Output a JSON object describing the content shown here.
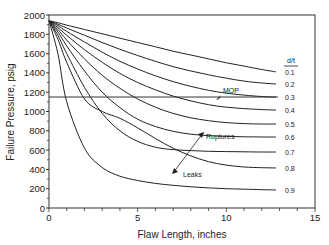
{
  "chart_data": {
    "type": "line",
    "title": "",
    "xlabel": "Flaw Length, inches",
    "ylabel": "Failure Pressure, psig",
    "xlim": [
      0,
      15
    ],
    "ylim": [
      0,
      2000
    ],
    "x_ticks": [
      0,
      5,
      10,
      15
    ],
    "y_ticks": [
      0,
      200,
      400,
      600,
      800,
      1000,
      1200,
      1400,
      1600,
      1800,
      2000
    ],
    "grid": false,
    "legend_title": "d/t",
    "legend_position": "right",
    "x": [
      0,
      0.5,
      1,
      2,
      3,
      4,
      5,
      6,
      7,
      8,
      9,
      10,
      11,
      12,
      12.8
    ],
    "series": [
      {
        "name": "0.1",
        "values": [
          1940,
          1920,
          1895,
          1850,
          1805,
          1760,
          1715,
          1670,
          1625,
          1585,
          1545,
          1505,
          1470,
          1435,
          1410
        ]
      },
      {
        "name": "0.2",
        "values": [
          1940,
          1905,
          1865,
          1790,
          1715,
          1645,
          1580,
          1520,
          1465,
          1420,
          1380,
          1345,
          1315,
          1295,
          1285
        ]
      },
      {
        "name": "0.3",
        "values": [
          1940,
          1890,
          1830,
          1720,
          1615,
          1520,
          1440,
          1370,
          1310,
          1260,
          1220,
          1190,
          1170,
          1155,
          1150
        ]
      },
      {
        "name": "0.4",
        "values": [
          1940,
          1870,
          1790,
          1640,
          1510,
          1395,
          1300,
          1225,
          1160,
          1110,
          1070,
          1045,
          1030,
          1020,
          1015
        ]
      },
      {
        "name": "0.5",
        "values": [
          1940,
          1850,
          1740,
          1545,
          1375,
          1240,
          1130,
          1045,
          980,
          935,
          905,
          885,
          875,
          870,
          870
        ]
      },
      {
        "name": "0.6",
        "values": [
          1940,
          1825,
          1680,
          1420,
          1200,
          1040,
          920,
          845,
          795,
          765,
          750,
          742,
          738,
          736,
          736
        ]
      },
      {
        "name": "0.7",
        "values": [
          1940,
          1790,
          1600,
          1250,
          980,
          800,
          690,
          630,
          605,
          595,
          588,
          584,
          582,
          580,
          580
        ]
      },
      {
        "name": "0.8",
        "values": [
          1940,
          1750,
          1510,
          1130,
          1000,
          930,
          830,
          720,
          620,
          540,
          480,
          445,
          425,
          418,
          415
        ]
      },
      {
        "name": "0.9",
        "values": [
          1940,
          1600,
          1100,
          620,
          420,
          330,
          285,
          255,
          235,
          220,
          208,
          200,
          195,
          190,
          187
        ]
      }
    ],
    "reference_lines": [
      {
        "name": "MOP",
        "y": 1150
      }
    ],
    "annotations": [
      {
        "text": "MOP",
        "x": 9.2,
        "y": 1190
      },
      {
        "text": "Ruptures",
        "x": 8.6,
        "y": 650,
        "arrow": "double-headed between Leaks (4.5, 340) and Ruptures (8.5, 720)"
      },
      {
        "text": "Leaks",
        "x": 6.5,
        "y": 280
      }
    ]
  },
  "labels": {
    "legend_title": "d/t",
    "xlabel": "Flaw Length, inches",
    "ylabel": "Failure Pressure, psig",
    "mop": "MOP",
    "ruptures": "Ruptures",
    "leaks": "Leaks"
  }
}
